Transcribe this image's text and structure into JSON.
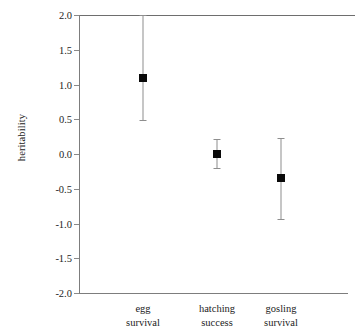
{
  "chart_data": {
    "type": "scatter",
    "title": "",
    "subtitle": "",
    "xlabel": "",
    "ylabel": "heritability",
    "categories": [
      "egg\nsurvival",
      "hatching\nsuccess",
      "gosling\nsurvival"
    ],
    "category_lines": [
      [
        "egg",
        "survival"
      ],
      [
        "hatching",
        "success"
      ],
      [
        "gosling",
        "survival"
      ]
    ],
    "values": [
      1.09,
      0.0,
      -0.34
    ],
    "error_low": [
      0.49,
      -0.2,
      -0.93
    ],
    "error_high": [
      2.0,
      0.21,
      0.23
    ],
    "series": [
      {
        "name": "heritability estimate",
        "points": [
          {
            "category": "egg survival",
            "value": 1.09,
            "ci_low": 0.49,
            "ci_high": 2.0
          },
          {
            "category": "hatching success",
            "value": 0.0,
            "ci_low": -0.2,
            "ci_high": 0.21
          },
          {
            "category": "gosling survival",
            "value": -0.34,
            "ci_low": -0.93,
            "ci_high": 0.23
          }
        ]
      }
    ],
    "ylim": [
      -2.0,
      2.0
    ],
    "yticks": [
      2.0,
      1.5,
      1.0,
      0.5,
      0.0,
      -0.5,
      -1.0,
      -1.5,
      -2.0
    ],
    "ytick_labels": [
      "2.0",
      "1.5",
      "1.0",
      "0.5",
      "0.0",
      "-0.5",
      "-1.0",
      "-1.5",
      "-2.0"
    ],
    "grid": false,
    "legend": "none",
    "zero_reference_line": 0.0,
    "marker_style": "filled-square",
    "colors": {
      "marker": "#0a0a0a",
      "error_bar": "#8e8e8e",
      "axis": "#7d7d7d",
      "zero_line": "#6e6e6e",
      "text": "#1c1c1c",
      "background": "#ffffff"
    }
  }
}
